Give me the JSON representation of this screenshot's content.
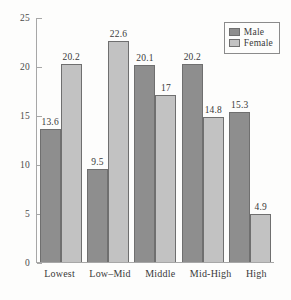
{
  "chart_data": {
    "type": "bar",
    "title": "",
    "subtitle": "",
    "xlabel": "",
    "ylabel": "",
    "categories": [
      "Lowest",
      "Low–Mid",
      "Middle",
      "Mid-High",
      "High"
    ],
    "series": [
      {
        "name": "Male",
        "color": "#8e8e8e",
        "values": [
          13.6,
          9.5,
          20.1,
          20.2,
          15.3
        ]
      },
      {
        "name": "Female",
        "color": "#c2c2c2",
        "values": [
          20.2,
          22.6,
          17,
          14.8,
          4.9
        ]
      }
    ],
    "value_labels": {
      "male": [
        "13.6",
        "9.5",
        "20.1",
        "20.2",
        "15.3"
      ],
      "female": [
        "20.2",
        "22.6",
        "17",
        "14.8",
        "4.9"
      ]
    },
    "ylim": [
      0,
      25
    ],
    "yticks": [
      0,
      5,
      10,
      15,
      20,
      25
    ],
    "ytick_labels": [
      "0",
      "5",
      "10",
      "15",
      "20",
      "25"
    ],
    "grid": false,
    "legend_position": "top-right"
  },
  "legend": {
    "entries": [
      {
        "label": "Male"
      },
      {
        "label": "Female"
      }
    ]
  }
}
